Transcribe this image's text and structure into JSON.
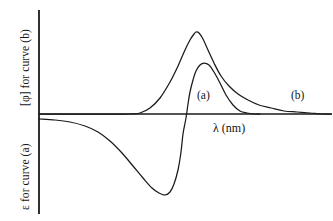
{
  "figure": {
    "background_color": "#ffffff",
    "line_color": "#1a1a1a",
    "axes": {
      "y_axis_label_top": "[φ] for curve (b)",
      "y_axis_label_bottom": "ε for curve (a)",
      "x_axis_label": "λ  (nm)",
      "y_axis_x_px": 39,
      "x_axis_y_px": 114
    },
    "annotations": {
      "curve_a": "(a)",
      "curve_b": "(b)"
    }
  },
  "chart_data": {
    "type": "line",
    "title": "",
    "subtitle": "",
    "xlabel": "λ  (nm)",
    "ylabel": "[φ] for curve (b)",
    "ylabel_secondary": "ε for curve (a)",
    "grid": false,
    "legend": "inline-annotations",
    "axis_ticks": false,
    "tick_labels": [],
    "xlim_px": [
      39,
      333
    ],
    "ylim_px": [
      10,
      214
    ],
    "zero_line_y_px": 114,
    "series": [
      {
        "name": "(b)",
        "label": "(b)",
        "description": "Single positive Gaussian-like absorption/CD band with long right tail, baseline at zero",
        "color": "#1a1a1a",
        "annotation_position_px": [
          291,
          90
        ],
        "points_px": [
          [
            39,
            114
          ],
          [
            100,
            114
          ],
          [
            130,
            114
          ],
          [
            140,
            113
          ],
          [
            150,
            108
          ],
          [
            160,
            98
          ],
          [
            170,
            82
          ],
          [
            178,
            66
          ],
          [
            185,
            50
          ],
          [
            190,
            40
          ],
          [
            194,
            34
          ],
          [
            196,
            32
          ],
          [
            199,
            33
          ],
          [
            203,
            39
          ],
          [
            208,
            50
          ],
          [
            214,
            63
          ],
          [
            221,
            76
          ],
          [
            229,
            86
          ],
          [
            238,
            94
          ],
          [
            248,
            100
          ],
          [
            259,
            105
          ],
          [
            271,
            108
          ],
          [
            284,
            111
          ],
          [
            297,
            112
          ],
          [
            310,
            113
          ],
          [
            322,
            114
          ],
          [
            331,
            114
          ]
        ]
      },
      {
        "name": "(a)",
        "label": "(a)",
        "description": "Cotton effect ORD curve: negative trough then steep crossover to positive peak then decay to baseline",
        "color": "#1a1a1a",
        "annotation_position_px": [
          197,
          90
        ],
        "points_px": [
          [
            39,
            119
          ],
          [
            55,
            120
          ],
          [
            70,
            122
          ],
          [
            85,
            126
          ],
          [
            98,
            132
          ],
          [
            110,
            141
          ],
          [
            122,
            153
          ],
          [
            133,
            166
          ],
          [
            143,
            178
          ],
          [
            152,
            188
          ],
          [
            159,
            193
          ],
          [
            165,
            195
          ],
          [
            170,
            192
          ],
          [
            174,
            184
          ],
          [
            178,
            170
          ],
          [
            181,
            152
          ],
          [
            183,
            134
          ],
          [
            186,
            118
          ],
          [
            188,
            104
          ],
          [
            190,
            92
          ],
          [
            193,
            80
          ],
          [
            196,
            71
          ],
          [
            200,
            65
          ],
          [
            204,
            63
          ],
          [
            209,
            65
          ],
          [
            214,
            72
          ],
          [
            220,
            83
          ],
          [
            226,
            95
          ],
          [
            233,
            105
          ],
          [
            240,
            111
          ],
          [
            247,
            113
          ],
          [
            254,
            114
          ],
          [
            260,
            114
          ]
        ]
      }
    ]
  }
}
